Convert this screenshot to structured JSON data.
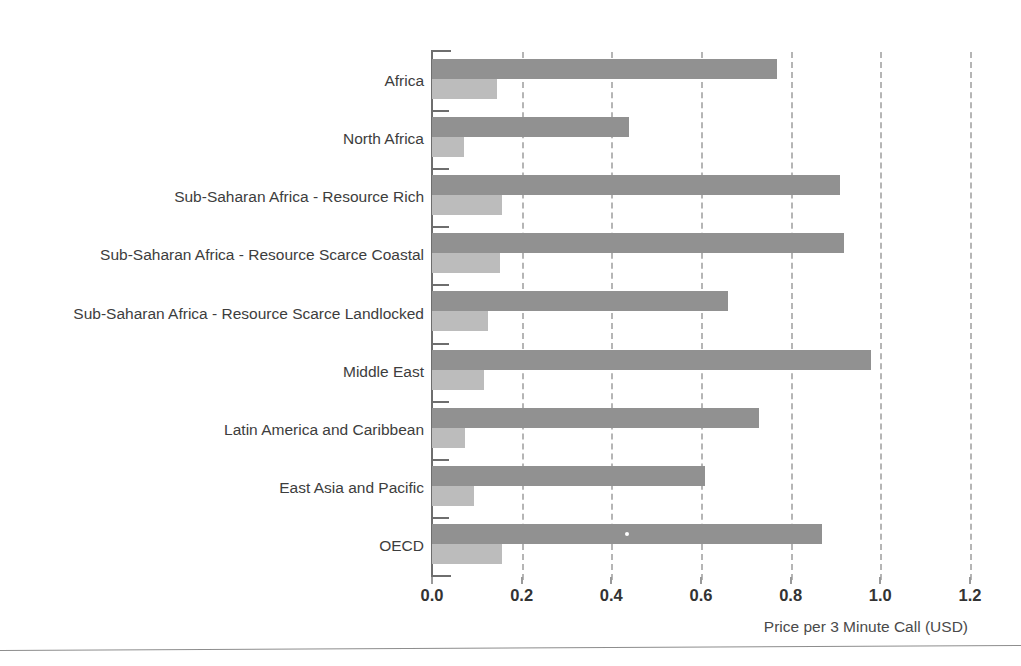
{
  "chart_data": {
    "type": "bar",
    "orientation": "horizontal",
    "title": "",
    "xlabel": "Price per 3 Minute Call (USD)",
    "ylabel": "",
    "xlim": [
      0.0,
      1.2
    ],
    "xticks": [
      "0.0",
      "0.2",
      "0.4",
      "0.6",
      "0.8",
      "1.0",
      "1.2"
    ],
    "xtick_values": [
      0.0,
      0.2,
      0.4,
      0.6,
      0.8,
      1.0,
      1.2
    ],
    "grid": "vertical-dashed",
    "legend": "none",
    "categories": [
      "Africa",
      "North Africa",
      "Sub-Saharan Africa - Resource Rich",
      "Sub-Saharan Africa - Resource Scarce Coastal",
      "Sub-Saharan Africa - Resource Scarce Landlocked",
      "Middle East",
      "Latin America and Caribbean",
      "East Asia and Pacific",
      "OECD"
    ],
    "series": [
      {
        "name": "series-dark",
        "color": "#919191",
        "values": [
          0.77,
          0.44,
          0.91,
          0.92,
          0.66,
          0.98,
          0.73,
          0.61,
          0.87
        ]
      },
      {
        "name": "series-light",
        "color": "#bcbcbc",
        "values": [
          0.145,
          0.072,
          0.156,
          0.152,
          0.125,
          0.116,
          0.074,
          0.094,
          0.156
        ]
      }
    ]
  },
  "colors": {
    "dark_bar": "#919191",
    "light_bar": "#bcbcbc",
    "axis": "#6e6e6e",
    "gridline": "#b5b5b5",
    "text": "#3d3d3d",
    "background": "#ffffff"
  }
}
